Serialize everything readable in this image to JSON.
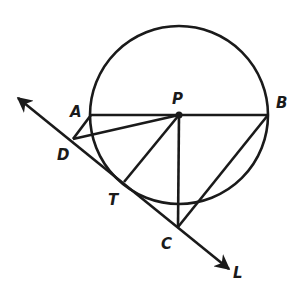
{
  "diagram": {
    "type": "geometry",
    "stroke_color": "#1a1a1a",
    "background": "#ffffff",
    "circle": {
      "center_label": "P",
      "center": [
        179,
        115
      ],
      "radius": 89
    },
    "points": {
      "A": {
        "label": "A",
        "xy": [
          91,
          115
        ],
        "label_xy": [
          70,
          117
        ]
      },
      "P": {
        "label": "P",
        "xy": [
          179,
          115
        ],
        "label_xy": [
          172,
          104
        ]
      },
      "B": {
        "label": "B",
        "xy": [
          268,
          115
        ],
        "label_xy": [
          276,
          108
        ]
      },
      "D": {
        "label": "D",
        "xy": [
          73,
          139
        ],
        "label_xy": [
          57,
          160
        ]
      },
      "T": {
        "label": "T",
        "xy": [
          124,
          182
        ],
        "label_xy": [
          108,
          205
        ]
      },
      "C": {
        "label": "C",
        "xy": [
          178,
          227
        ],
        "label_xy": [
          161,
          249
        ]
      },
      "L": {
        "label": "L",
        "xy": [
          229,
          269
        ],
        "label_xy": [
          233,
          278
        ]
      }
    },
    "segments": [
      {
        "from": "A",
        "to": "B",
        "note": "diameter AB"
      },
      {
        "from": "A",
        "to": "D"
      },
      {
        "from": "D",
        "to": "P"
      },
      {
        "from": "P",
        "to": "T"
      },
      {
        "from": "P",
        "to": "C"
      },
      {
        "from": "B",
        "to": "C"
      }
    ],
    "line": {
      "label": "L",
      "from": [
        18,
        98
      ],
      "to": [
        229,
        269
      ],
      "arrows": "both",
      "passes_through": [
        "D",
        "T",
        "C"
      ],
      "tangent_at": "T"
    }
  }
}
